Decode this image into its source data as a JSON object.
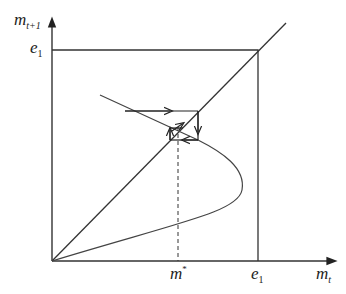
{
  "diagram": {
    "type": "cobweb-phase-diagram",
    "axes": {
      "y_label": {
        "base": "m",
        "sub": "t+1"
      },
      "x_label": {
        "base": "m",
        "sub": "t"
      }
    },
    "ticks": {
      "y_e1": {
        "base": "e",
        "sub": "1"
      },
      "x_e1": {
        "base": "e",
        "sub": "1"
      },
      "x_mstar": {
        "base": "m",
        "sup": "*"
      }
    },
    "elements": [
      "45-degree line",
      "backward-bending map curve",
      "boundary box at e1",
      "cobweb path converging to fixed point m*",
      "dashed vertical line at m*"
    ],
    "colors": {
      "line": "#333333",
      "curve": "#444444",
      "background": "#ffffff"
    }
  }
}
